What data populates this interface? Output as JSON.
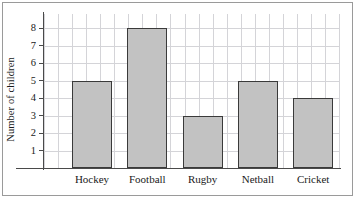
{
  "chart_data": {
    "type": "bar",
    "title": "",
    "xlabel": "",
    "ylabel": "Number of children",
    "categories": [
      "Hockey",
      "Football",
      "Rugby",
      "Netball",
      "Cricket"
    ],
    "values": [
      5,
      8,
      3,
      5,
      4
    ],
    "ylim": [
      0,
      9
    ],
    "y_ticks": [
      1,
      2,
      3,
      4,
      5,
      6,
      7,
      8
    ],
    "y_tick_labels": [
      "1",
      "2",
      "3",
      "4",
      "5",
      "6",
      "7",
      "8"
    ],
    "grid": true,
    "legend": null,
    "bar_fill_color": "#c2c2c2",
    "bar_edge_color": "#3a3a3a",
    "grid_color": "#d4d4d8",
    "axis_color": "#4a4a4a",
    "background_color": "#ffffff",
    "frame_color": "#9a9a9a"
  }
}
